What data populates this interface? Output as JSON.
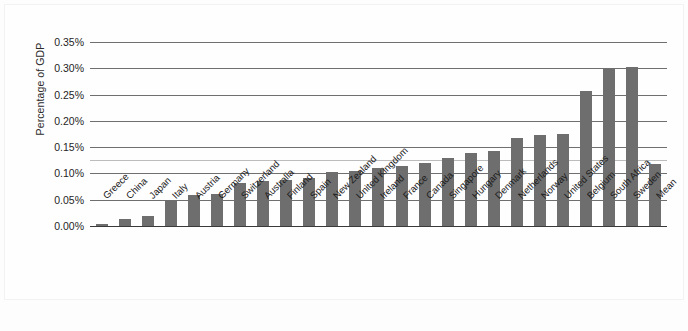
{
  "chart_data": {
    "type": "bar",
    "title": "",
    "subtitle": "",
    "xlabel": "",
    "ylabel": "Percentage of GDP",
    "ylim": [
      0,
      0.35
    ],
    "ytick_labels": [
      "0.35%",
      "0.30%",
      "0.25%",
      "0.20%",
      "0.15%",
      "0.10%",
      "0.05%",
      "0.00%"
    ],
    "ytick_values": [
      0.35,
      0.3,
      0.25,
      0.2,
      0.15,
      0.1,
      0.05,
      0.0
    ],
    "grid": "horizontal",
    "legend": "none",
    "bar_color": "#6e6e6e",
    "axis_color": "#3a3a3a",
    "gridline_color": "#6f6f6f",
    "background_color": "#fdfdfd",
    "categories": [
      "Greece",
      "China",
      "Japan",
      "Italy",
      "Austria",
      "Germany",
      "Switzerland",
      "Australia",
      "Finland",
      "Spain",
      "New Zealand",
      "United Kingdom",
      "Ireland",
      "France",
      "Canada",
      "Singapore",
      "Hungary",
      "Denmark",
      "Netherlands",
      "Norway",
      "United States",
      "Belgium",
      "South Africa",
      "Sweden",
      "Mean"
    ],
    "values": [
      0.004,
      0.014,
      0.019,
      0.05,
      0.059,
      0.06,
      0.082,
      0.085,
      0.088,
      0.091,
      0.102,
      0.105,
      0.11,
      0.115,
      0.12,
      0.13,
      0.138,
      0.143,
      0.167,
      0.174,
      0.175,
      0.256,
      0.299,
      0.302,
      0.118
    ],
    "value_unit": "percent"
  }
}
